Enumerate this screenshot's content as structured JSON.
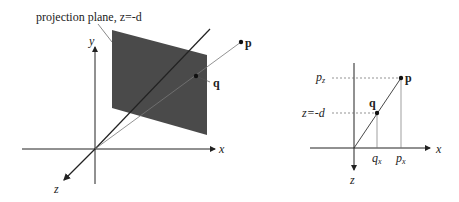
{
  "left": {
    "plane_label": "projection plane, z=-d",
    "axis_x": "x",
    "axis_y": "y",
    "axis_z": "z",
    "point_p": "p",
    "point_q": "q"
  },
  "right": {
    "label_pz": "p",
    "label_pz_sub": "z",
    "label_zd": "z=-d",
    "point_p": "p",
    "point_q": "q",
    "label_qx": "q",
    "label_qx_sub": "x",
    "label_px": "p",
    "label_px_sub": "x",
    "axis_x": "x",
    "axis_z": "z"
  },
  "colors": {
    "plane": "#4a4a4a",
    "line": "#222222"
  }
}
